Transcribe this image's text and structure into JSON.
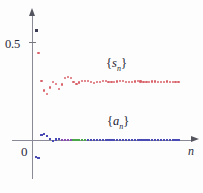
{
  "chart_data": {
    "type": "scatter",
    "title": "",
    "xlabel": "n",
    "ylabel": "",
    "grid": false,
    "legend_position": "inline-annotations",
    "xlim": [
      0,
      56
    ],
    "ylim": [
      -0.12,
      0.62
    ],
    "yticks": [
      0.5
    ],
    "ytick_labels": [
      "0.5"
    ],
    "origin_label": "0",
    "annotations": [
      {
        "text": "{s_n}",
        "x": 22,
        "y": 0.42
      },
      {
        "text": "{a_n}",
        "x": 22,
        "y": 0.125
      }
    ],
    "series": [
      {
        "name": "{s_n}",
        "label": "{s_n}",
        "color": "#d9636b",
        "first_point_color": "#3c3c55",
        "x": [
          1,
          2,
          3,
          4,
          5,
          6,
          7,
          8,
          9,
          10,
          11,
          12,
          13,
          14,
          15,
          16,
          17,
          18,
          19,
          20,
          21,
          22,
          23,
          24,
          25,
          26,
          27,
          28,
          29,
          30,
          31,
          32,
          33,
          34,
          35,
          36,
          37,
          38,
          39,
          40,
          41,
          42,
          43,
          44,
          45,
          46,
          47,
          48,
          49,
          50
        ],
        "values": [
          0.565,
          0.445,
          0.305,
          0.255,
          0.235,
          0.27,
          0.3,
          0.288,
          0.262,
          0.285,
          0.318,
          0.322,
          0.318,
          0.3,
          0.288,
          0.295,
          0.302,
          0.305,
          0.302,
          0.298,
          0.294,
          0.296,
          0.3,
          0.304,
          0.303,
          0.3,
          0.298,
          0.299,
          0.301,
          0.303,
          0.302,
          0.3,
          0.299,
          0.3,
          0.301,
          0.302,
          0.301,
          0.3,
          0.299,
          0.3,
          0.301,
          0.301,
          0.3,
          0.3,
          0.3,
          0.301,
          0.3,
          0.3,
          0.3,
          0.3
        ]
      },
      {
        "name": "{a_n}",
        "label": "{a_n}",
        "color": "#4a4ab4",
        "secondary_colors": [
          "#8a4ab4",
          "#4aa84a"
        ],
        "x": [
          1,
          2,
          3,
          4,
          5,
          6,
          7,
          8,
          9,
          10,
          11,
          12,
          13,
          14,
          15,
          16,
          17,
          18,
          19,
          20,
          21,
          22,
          23,
          24,
          25,
          26,
          27,
          28,
          29,
          30,
          31,
          32,
          33,
          34,
          35,
          36,
          37,
          38,
          39,
          40,
          41,
          42,
          43,
          44,
          45,
          46,
          47,
          48,
          49,
          50
        ],
        "values": [
          -0.085,
          -0.09,
          0.028,
          0.034,
          0.022,
          0.006,
          -0.002,
          0.004,
          0.005,
          0.002,
          0.0,
          0.0,
          0.001,
          0.0,
          0.0,
          0.0,
          0.0,
          0.0,
          0.0,
          0.0,
          0.0,
          0.0,
          0.0,
          0.0,
          0.0,
          0.0,
          0.0,
          0.0,
          0.0,
          0.0,
          0.0,
          0.0,
          0.0,
          0.0,
          0.0,
          0.0,
          0.0,
          0.0,
          0.0,
          0.0,
          0.0,
          0.0,
          0.0,
          0.0,
          0.0,
          0.0,
          0.0,
          0.0,
          0.0,
          0.0
        ]
      }
    ]
  },
  "labels": {
    "y_half": "0.5",
    "origin": "0",
    "x_axis": "n",
    "series_s_open": "{",
    "series_s_var": "s",
    "series_s_sub": "n",
    "series_s_close": "}",
    "series_a_open": "{",
    "series_a_var": "a",
    "series_a_sub": "n",
    "series_a_close": "}"
  }
}
